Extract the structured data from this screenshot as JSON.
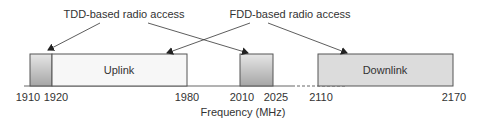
{
  "annotations": {
    "tdd": "TDD-based radio access",
    "fdd": "FDD-based radio access"
  },
  "axis": {
    "label": "Frequency (MHz)",
    "ticks": [
      "1910",
      "1920",
      "1980",
      "2010",
      "2025",
      "2110",
      "2170"
    ]
  },
  "bands": [
    {
      "name": "tdd-band-low",
      "label": "",
      "from": 1910,
      "to": 1920,
      "kind": "tdd"
    },
    {
      "name": "uplink-band",
      "label": "Uplink",
      "from": 1920,
      "to": 1980,
      "kind": "uplink"
    },
    {
      "name": "tdd-band-high",
      "label": "",
      "from": 2010,
      "to": 2025,
      "kind": "tdd"
    },
    {
      "name": "downlink-band",
      "label": "Downlink",
      "from": 2110,
      "to": 2170,
      "kind": "downlink"
    }
  ],
  "colors": {
    "tdd_top": "#e4e4e4",
    "tdd_bottom": "#a8a8a8",
    "uplink": "#f7f7f7",
    "downlink": "#dcdcdc",
    "stroke": "#555555",
    "text": "#333333"
  }
}
